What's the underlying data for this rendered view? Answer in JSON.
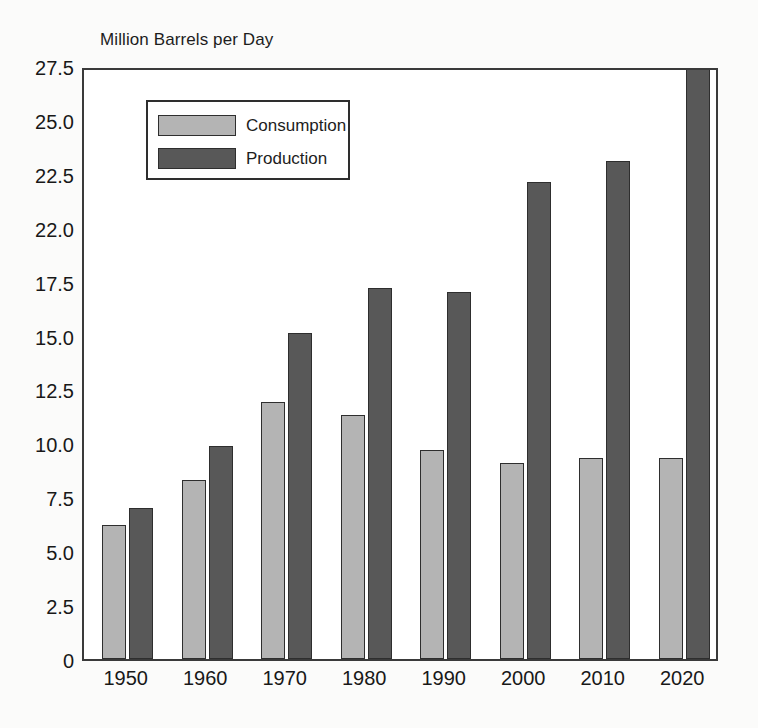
{
  "chart_data": {
    "type": "bar",
    "title": "Million Barrels per Day",
    "xlabel": "",
    "ylabel": "Million Barrels per Day",
    "categories": [
      "1950",
      "1960",
      "1970",
      "1980",
      "1990",
      "2000",
      "2010",
      "2020"
    ],
    "series": [
      {
        "name": "Consumption",
        "color": "#b4b4b4",
        "values": [
          6.2,
          8.3,
          11.9,
          11.3,
          9.7,
          9.1,
          9.3,
          9.3
        ]
      },
      {
        "name": "Production",
        "color": "#585858",
        "values": [
          7.0,
          9.9,
          15.1,
          17.2,
          17.0,
          22.1,
          23.1,
          27.5
        ]
      }
    ],
    "ylim": [
      0,
      27.5
    ],
    "ytick_labels": [
      "27.5",
      "25.0",
      "22.5",
      "22.0",
      "17.5",
      "15.0",
      "12.5",
      "10.0",
      "7.5",
      "5.0",
      "2.5",
      "0"
    ],
    "ytick_positions": [
      27.5,
      25.0,
      22.5,
      20.0,
      17.5,
      15.0,
      12.5,
      10.0,
      7.5,
      5.0,
      2.5,
      0
    ],
    "grid": false,
    "legend_position": "upper-left-inside"
  },
  "legend": {
    "items": [
      {
        "label": "Consumption",
        "swatch": "light-gray"
      },
      {
        "label": "Production",
        "swatch": "dark-gray"
      }
    ]
  }
}
